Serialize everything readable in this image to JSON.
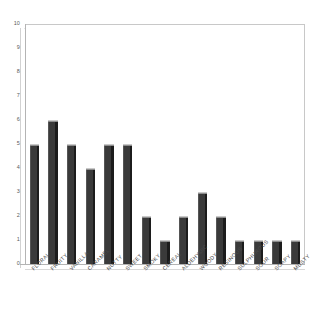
{
  "chart_data": {
    "type": "bar",
    "title": "",
    "subtitle": "",
    "xlabel": "",
    "ylabel": "",
    "categories": [
      "FLORAL",
      "FRUITY",
      "VANILLA",
      "CARAMEL",
      "NUTTY",
      "SWEET",
      "SMOKY",
      "CEREAL",
      "ALDEHYDIC",
      "WOODY",
      "RESINOUS",
      "SULPHUROUS",
      "SOUR",
      "SOAPY",
      "MUSTY"
    ],
    "values": [
      5,
      6,
      5,
      4,
      5,
      5,
      2,
      1,
      2,
      3,
      2,
      1,
      1,
      1,
      1
    ],
    "ylim": [
      0,
      10
    ],
    "ytick_labels": [
      "0",
      "1",
      "2",
      "3",
      "4",
      "5",
      "6",
      "7",
      "8",
      "9",
      "10"
    ],
    "ytick_values": [
      0,
      1,
      2,
      3,
      4,
      5,
      6,
      7,
      8,
      9,
      10
    ],
    "grid": false,
    "legend": false,
    "legend_position": "none",
    "annotations": [],
    "style": {
      "bar_face_color": "#3a3a3a",
      "bar_side_color": "#1c1c1c",
      "bar_cap_color": "#8e8e8e",
      "plot_background": "#ffffff",
      "frame_color": "#c8c8c8",
      "axis_color": "#b4b4b4",
      "tick_label_color": "#5a5a5a",
      "category_label_color": "#4a4a4a",
      "three_d": true,
      "label_rotation_deg": -45
    }
  }
}
